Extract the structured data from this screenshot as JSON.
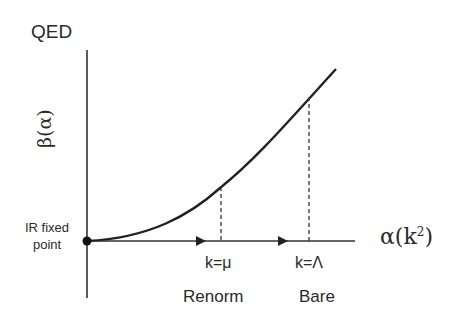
{
  "diagram": {
    "title": "QED",
    "y_axis_label": "β(α)",
    "x_axis_label_base": "α(k",
    "x_axis_label_exp": "2",
    "x_axis_label_close": ")",
    "origin_label_line1": "IR fixed",
    "origin_label_line2": "point",
    "markers": [
      {
        "tick": "k=μ",
        "name": "Renorm"
      },
      {
        "tick": "k=Λ",
        "name": "Bare"
      }
    ],
    "curve": "β(α) increasing convex from IR fixed point at origin",
    "colors": {
      "ink": "#222222",
      "background": "#ffffff"
    }
  }
}
